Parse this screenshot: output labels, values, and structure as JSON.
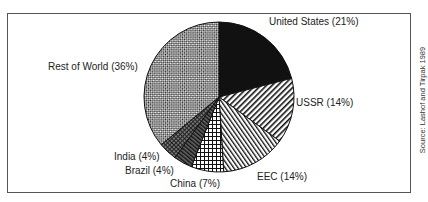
{
  "chart_data": {
    "type": "pie",
    "title": "",
    "slices": [
      {
        "label": "United States",
        "value": 21,
        "display": "United States (21%)",
        "pattern": "solid-black"
      },
      {
        "label": "USSR",
        "value": 14,
        "display": "USSR (14%)",
        "pattern": "diagonal-dense"
      },
      {
        "label": "EEC",
        "value": 14,
        "display": "EEC (14%)",
        "pattern": "diagonal-fine"
      },
      {
        "label": "China",
        "value": 7,
        "display": "China (7%)",
        "pattern": "grid"
      },
      {
        "label": "Brazil",
        "value": 4,
        "display": "Brazil (4%)",
        "pattern": "dark-diagonal"
      },
      {
        "label": "India",
        "value": 4,
        "display": "India (4%)",
        "pattern": "dark-crosshatch"
      },
      {
        "label": "Rest of World",
        "value": 36,
        "display": "Rest of World (36%)",
        "pattern": "checker"
      }
    ],
    "start_angle_deg": 0,
    "direction": "clockwise",
    "legend": "inline-labels"
  },
  "labels": {
    "us": "United States (21%)",
    "ussr": "USSR (14%)",
    "eec": "EEC (14%)",
    "china": "China (7%)",
    "brazil": "Brazil (4%)",
    "india": "India (4%)",
    "row": "Rest of World (36%)"
  },
  "source": "Source: Lashof and Tirpak 1989"
}
